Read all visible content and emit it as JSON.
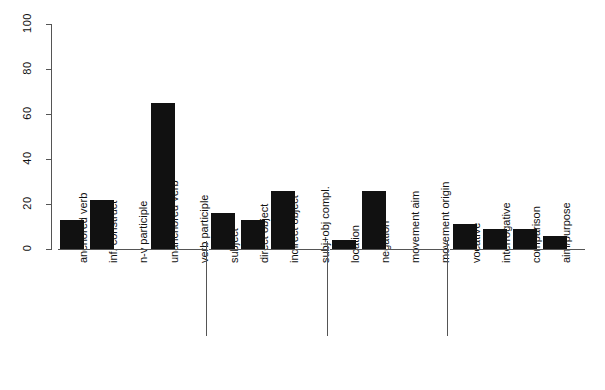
{
  "chart_data": {
    "type": "bar",
    "title": "",
    "subtitle": "",
    "xlabel": "",
    "ylabel": "",
    "ylim": [
      0,
      100
    ],
    "yticks": [
      0,
      20,
      40,
      60,
      80,
      100
    ],
    "grid": false,
    "legend": false,
    "orientation": "vertical",
    "bar_color": "#111111",
    "axis_color": "#555555",
    "categories": [
      "anchored verb",
      "inf. construct",
      "n-v participle",
      "unanchored verb",
      "verb participle",
      "subject",
      "direct object",
      "indirect object",
      "subj+obj compl.",
      "location",
      "negation",
      "movement aim",
      "movement origin",
      "vocative",
      "interrogative",
      "comparison",
      "aim/purpose"
    ],
    "values": [
      13,
      22,
      0,
      65,
      0,
      16,
      13,
      26,
      0,
      4,
      26,
      0,
      0,
      11,
      9,
      9,
      6
    ],
    "groups": [
      {
        "name": "verbal",
        "start": 0,
        "end": 4
      },
      {
        "name": "arguments",
        "start": 5,
        "end": 8
      },
      {
        "name": "adjuncts",
        "start": 9,
        "end": 12
      },
      {
        "name": "other",
        "start": 13,
        "end": 16
      }
    ]
  }
}
